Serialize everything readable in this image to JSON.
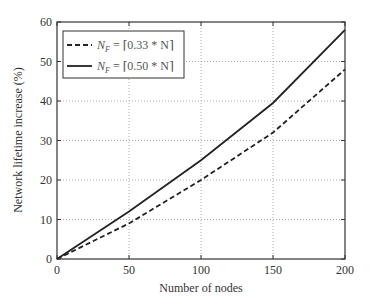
{
  "chart_data": {
    "type": "line",
    "title": "",
    "xlabel": "Number of nodes",
    "ylabel": "Network lifetime increase (%)",
    "xlim": [
      0,
      200
    ],
    "ylim": [
      0,
      60
    ],
    "xticks": [
      0,
      50,
      100,
      150,
      200
    ],
    "yticks": [
      0,
      10,
      20,
      30,
      40,
      50,
      60
    ],
    "grid": true,
    "legend_position": "upper left",
    "x": [
      0,
      50,
      100,
      150,
      200
    ],
    "series": [
      {
        "name": "N_F = ⌈0.33 * N⌉",
        "legend_sym": "N",
        "legend_sub": "F",
        "legend_rest": " = ⌈0.33 * N⌉",
        "style": "dashed",
        "color": "#222222",
        "values": [
          0,
          9,
          20,
          32,
          48
        ]
      },
      {
        "name": "N_F = ⌈0.50 * N⌉",
        "legend_sym": "N",
        "legend_sub": "F",
        "legend_rest": " = ⌈0.50 * N⌉",
        "style": "solid",
        "color": "#222222",
        "values": [
          0,
          12,
          25,
          39.5,
          58
        ]
      }
    ]
  }
}
